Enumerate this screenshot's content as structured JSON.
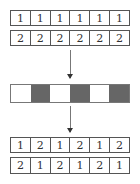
{
  "diagram": {
    "input_rows": [
      [
        "1",
        "1",
        "1",
        "1",
        "1",
        "1"
      ],
      [
        "2",
        "2",
        "2",
        "2",
        "2",
        "2"
      ]
    ],
    "mask": {
      "segments": [
        "light",
        "dark",
        "light",
        "dark",
        "light",
        "dark"
      ],
      "colors": {
        "light": "#ffffff",
        "dark": "#666666"
      }
    },
    "output_rows": [
      [
        "1",
        "2",
        "1",
        "2",
        "1",
        "2"
      ],
      [
        "2",
        "1",
        "2",
        "1",
        "2",
        "1"
      ]
    ]
  }
}
